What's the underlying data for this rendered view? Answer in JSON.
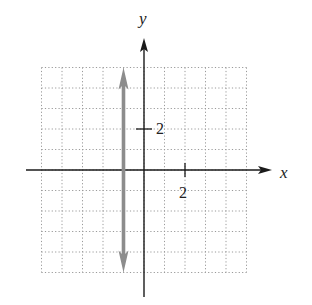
{
  "chart_data": {
    "type": "line",
    "title": "",
    "xlabel": "x",
    "ylabel": "y",
    "xlim": [
      -5,
      5
    ],
    "ylim": [
      -5,
      5
    ],
    "grid": true,
    "grid_style": "dotted",
    "tick_labels": {
      "x": [
        {
          "value": 2,
          "label": "2"
        }
      ],
      "y": [
        {
          "value": 2,
          "label": "2"
        }
      ]
    },
    "series": [
      {
        "name": "vertical line x = -1",
        "equation": "x = -1",
        "x": [
          -1,
          -1
        ],
        "y": [
          -5,
          5
        ],
        "color": "#8c8c8c",
        "arrows": "both ends"
      }
    ]
  },
  "labels": {
    "x_axis": "x",
    "y_axis": "y",
    "x_tick": "2",
    "y_tick": "2"
  },
  "colors": {
    "axis": "#1a1a1a",
    "grid": "#9a9a9a",
    "line": "#8c8c8c"
  }
}
